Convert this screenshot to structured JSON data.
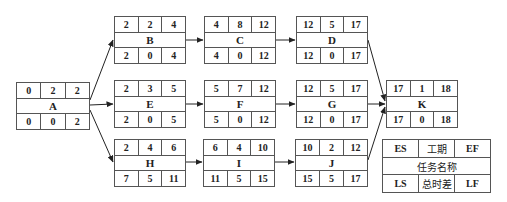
{
  "diagram": {
    "type": "activity-on-node network (critical path)",
    "nodes": [
      {
        "id": "A",
        "es": "0",
        "dur": "2",
        "ef": "2",
        "ls": "0",
        "tf": "0",
        "lf": "2",
        "x": 16,
        "y": 82
      },
      {
        "id": "B",
        "es": "2",
        "dur": "2",
        "ef": "4",
        "ls": "2",
        "tf": "0",
        "lf": "4",
        "x": 114,
        "y": 16
      },
      {
        "id": "C",
        "es": "4",
        "dur": "8",
        "ef": "12",
        "ls": "4",
        "tf": "0",
        "lf": "12",
        "x": 204,
        "y": 16
      },
      {
        "id": "D",
        "es": "12",
        "dur": "5",
        "ef": "17",
        "ls": "12",
        "tf": "0",
        "lf": "17",
        "x": 296,
        "y": 16
      },
      {
        "id": "E",
        "es": "2",
        "dur": "3",
        "ef": "5",
        "ls": "2",
        "tf": "0",
        "lf": "5",
        "x": 114,
        "y": 80
      },
      {
        "id": "F",
        "es": "5",
        "dur": "7",
        "ef": "12",
        "ls": "5",
        "tf": "0",
        "lf": "12",
        "x": 204,
        "y": 80
      },
      {
        "id": "G",
        "es": "12",
        "dur": "5",
        "ef": "17",
        "ls": "12",
        "tf": "0",
        "lf": "17",
        "x": 296,
        "y": 80
      },
      {
        "id": "H",
        "es": "2",
        "dur": "4",
        "ef": "6",
        "ls": "7",
        "tf": "5",
        "lf": "11",
        "x": 114,
        "y": 139
      },
      {
        "id": "I",
        "es": "6",
        "dur": "4",
        "ef": "10",
        "ls": "11",
        "tf": "5",
        "lf": "15",
        "x": 203,
        "y": 139
      },
      {
        "id": "J",
        "es": "10",
        "dur": "2",
        "ef": "12",
        "ls": "15",
        "tf": "5",
        "lf": "17",
        "x": 295,
        "y": 139
      },
      {
        "id": "K",
        "es": "17",
        "dur": "1",
        "ef": "18",
        "ls": "17",
        "tf": "0",
        "lf": "18",
        "x": 386,
        "y": 80
      }
    ],
    "edges": [
      [
        "A",
        "B"
      ],
      [
        "A",
        "E"
      ],
      [
        "A",
        "H"
      ],
      [
        "B",
        "C"
      ],
      [
        "C",
        "D"
      ],
      [
        "D",
        "K"
      ],
      [
        "E",
        "F"
      ],
      [
        "F",
        "G"
      ],
      [
        "G",
        "K"
      ],
      [
        "H",
        "I"
      ],
      [
        "I",
        "J"
      ],
      [
        "J",
        "K"
      ]
    ],
    "legend": {
      "es": "ES",
      "duration": "工期",
      "ef": "EF",
      "task_name": "任务名称",
      "ls": "LS",
      "total_float": "总时差",
      "lf": "LF"
    }
  }
}
